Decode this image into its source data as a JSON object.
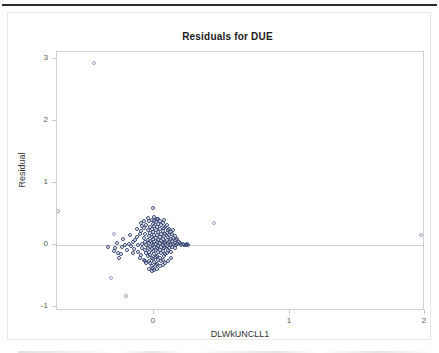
{
  "chart_data": {
    "type": "scatter",
    "title": "Residuals for DUE",
    "xlabel": "DLWkUNCLL1",
    "ylabel": "Residual",
    "xlim": [
      -0.72,
      2.0
    ],
    "ylim": [
      -1.06,
      3.12
    ],
    "xticks": [
      0,
      1,
      2
    ],
    "xtick_labels": [
      "0",
      "1",
      "2"
    ],
    "yticks": [
      -1,
      0,
      1,
      2,
      3
    ],
    "ytick_labels": [
      "-1",
      "0",
      "1",
      "2",
      "3"
    ],
    "grid": false,
    "legend": null,
    "reference_lines": [
      {
        "axis": "y",
        "value": 0,
        "color": "#cfcfcf"
      }
    ],
    "marker": {
      "shape": "open-circle",
      "color": "#3c4a78",
      "size": 4
    },
    "series": [
      {
        "name": "Residuals",
        "points": [
          [
            -0.45,
            2.95
          ],
          [
            -0.71,
            0.55
          ],
          [
            -0.3,
            0.18
          ],
          [
            0.44,
            0.36
          ],
          [
            1.97,
            0.17
          ],
          [
            -0.32,
            -0.53
          ],
          [
            -0.21,
            -0.82
          ],
          [
            -0.26,
            -0.2
          ],
          [
            -0.34,
            -0.02
          ],
          [
            -0.29,
            -0.05
          ],
          [
            -0.3,
            -0.09
          ],
          [
            -0.27,
            -0.12
          ],
          [
            -0.24,
            -0.03
          ],
          [
            -0.22,
            0.01
          ],
          [
            -0.19,
            0.02
          ],
          [
            -0.17,
            -0.01
          ],
          [
            -0.16,
            0.05
          ],
          [
            -0.15,
            -0.06
          ],
          [
            -0.14,
            0.09
          ],
          [
            -0.13,
            0.14
          ],
          [
            -0.12,
            -0.1
          ],
          [
            -0.12,
            0.0
          ],
          [
            -0.11,
            0.18
          ],
          [
            -0.1,
            0.23
          ],
          [
            -0.1,
            -0.16
          ],
          [
            -0.09,
            0.02
          ],
          [
            -0.09,
            -0.04
          ],
          [
            -0.08,
            0.12
          ],
          [
            -0.08,
            0.28
          ],
          [
            -0.08,
            -0.23
          ],
          [
            -0.07,
            0.06
          ],
          [
            -0.07,
            -0.08
          ],
          [
            -0.07,
            0.19
          ],
          [
            -0.06,
            0.33
          ],
          [
            -0.06,
            0.0
          ],
          [
            -0.06,
            -0.13
          ],
          [
            -0.06,
            -0.29
          ],
          [
            -0.05,
            0.09
          ],
          [
            -0.05,
            0.24
          ],
          [
            -0.05,
            -0.05
          ],
          [
            -0.05,
            -0.18
          ],
          [
            -0.04,
            0.39
          ],
          [
            -0.04,
            0.15
          ],
          [
            -0.04,
            0.03
          ],
          [
            -0.04,
            -0.1
          ],
          [
            -0.04,
            -0.25
          ],
          [
            -0.04,
            -0.38
          ],
          [
            -0.03,
            0.3
          ],
          [
            -0.03,
            0.2
          ],
          [
            -0.03,
            0.07
          ],
          [
            -0.03,
            -0.02
          ],
          [
            -0.03,
            -0.15
          ],
          [
            -0.03,
            -0.28
          ],
          [
            -0.02,
            0.41
          ],
          [
            -0.02,
            0.27
          ],
          [
            -0.02,
            0.13
          ],
          [
            -0.02,
            0.04
          ],
          [
            -0.02,
            -0.06
          ],
          [
            -0.02,
            -0.2
          ],
          [
            -0.02,
            -0.33
          ],
          [
            -0.01,
            0.6
          ],
          [
            -0.01,
            0.35
          ],
          [
            -0.01,
            0.22
          ],
          [
            -0.01,
            0.1
          ],
          [
            -0.01,
            0.01
          ],
          [
            -0.01,
            -0.09
          ],
          [
            -0.01,
            -0.22
          ],
          [
            -0.01,
            -0.37
          ],
          [
            0.0,
            0.4
          ],
          [
            0.0,
            0.31
          ],
          [
            0.0,
            0.17
          ],
          [
            0.0,
            0.06
          ],
          [
            0.0,
            -0.03
          ],
          [
            0.0,
            -0.14
          ],
          [
            0.0,
            -0.27
          ],
          [
            0.01,
            0.38
          ],
          [
            0.01,
            0.25
          ],
          [
            0.01,
            0.12
          ],
          [
            0.01,
            0.02
          ],
          [
            0.01,
            -0.07
          ],
          [
            0.01,
            -0.19
          ],
          [
            0.01,
            -0.31
          ],
          [
            0.02,
            0.42
          ],
          [
            0.02,
            0.29
          ],
          [
            0.02,
            0.16
          ],
          [
            0.02,
            0.05
          ],
          [
            0.02,
            -0.04
          ],
          [
            0.02,
            -0.17
          ],
          [
            0.02,
            -0.3
          ],
          [
            0.03,
            0.34
          ],
          [
            0.03,
            0.21
          ],
          [
            0.03,
            0.09
          ],
          [
            0.03,
            -0.01
          ],
          [
            0.03,
            -0.11
          ],
          [
            0.03,
            -0.24
          ],
          [
            0.04,
            0.4
          ],
          [
            0.04,
            0.26
          ],
          [
            0.04,
            0.14
          ],
          [
            0.04,
            0.03
          ],
          [
            0.04,
            -0.08
          ],
          [
            0.04,
            -0.21
          ],
          [
            0.05,
            0.32
          ],
          [
            0.05,
            0.19
          ],
          [
            0.05,
            0.07
          ],
          [
            0.05,
            -0.02
          ],
          [
            0.05,
            -0.13
          ],
          [
            0.05,
            -0.26
          ],
          [
            0.06,
            0.36
          ],
          [
            0.06,
            0.23
          ],
          [
            0.06,
            0.11
          ],
          [
            0.06,
            0.01
          ],
          [
            0.06,
            -0.09
          ],
          [
            0.06,
            -0.23
          ],
          [
            0.07,
            0.41
          ],
          [
            0.07,
            0.28
          ],
          [
            0.07,
            0.15
          ],
          [
            0.07,
            0.04
          ],
          [
            0.07,
            -0.05
          ],
          [
            0.07,
            -0.18
          ],
          [
            0.08,
            0.3
          ],
          [
            0.08,
            0.18
          ],
          [
            0.08,
            0.06
          ],
          [
            0.08,
            -0.03
          ],
          [
            0.08,
            -0.14
          ],
          [
            0.09,
            0.33
          ],
          [
            0.09,
            0.2
          ],
          [
            0.09,
            0.08
          ],
          [
            0.09,
            -0.01
          ],
          [
            0.09,
            -0.12
          ],
          [
            0.1,
            0.25
          ],
          [
            0.1,
            0.13
          ],
          [
            0.1,
            0.03
          ],
          [
            0.1,
            -0.07
          ],
          [
            0.11,
            0.27
          ],
          [
            0.11,
            0.16
          ],
          [
            0.11,
            0.05
          ],
          [
            0.11,
            -0.05
          ],
          [
            0.12,
            0.22
          ],
          [
            0.12,
            0.1
          ],
          [
            0.12,
            0.01
          ],
          [
            0.12,
            -0.1
          ],
          [
            0.13,
            0.19
          ],
          [
            0.13,
            0.07
          ],
          [
            0.13,
            -0.02
          ],
          [
            0.14,
            0.24
          ],
          [
            0.14,
            0.12
          ],
          [
            0.14,
            0.02
          ],
          [
            0.15,
            0.15
          ],
          [
            0.15,
            0.04
          ],
          [
            0.15,
            -0.04
          ],
          [
            0.16,
            0.09
          ],
          [
            0.16,
            0.0
          ],
          [
            0.17,
            0.11
          ],
          [
            0.17,
            0.02
          ],
          [
            0.18,
            0.05
          ],
          [
            0.19,
            0.03
          ],
          [
            0.2,
            0.01
          ],
          [
            0.21,
            0.02
          ],
          [
            0.22,
            0.0
          ],
          [
            0.23,
            0.01
          ],
          [
            0.24,
            0.02
          ],
          [
            0.25,
            0.01
          ],
          [
            -0.28,
            0.04
          ],
          [
            -0.25,
            -0.14
          ],
          [
            -0.23,
            0.11
          ],
          [
            -0.2,
            -0.07
          ],
          [
            -0.18,
            0.16
          ],
          [
            -0.16,
            -0.12
          ],
          [
            -0.13,
            0.26
          ],
          [
            -0.11,
            -0.21
          ],
          [
            -0.09,
            0.31
          ],
          [
            -0.07,
            -0.26
          ],
          [
            -0.05,
            0.44
          ],
          [
            0.0,
            -0.4
          ],
          [
            0.02,
            -0.38
          ],
          [
            0.04,
            -0.34
          ],
          [
            0.06,
            -0.32
          ],
          [
            -0.02,
            -0.42
          ],
          [
            0.08,
            -0.28
          ],
          [
            0.1,
            -0.25
          ],
          [
            0.12,
            -0.21
          ],
          [
            -0.1,
            0.36
          ],
          [
            -0.08,
            0.4
          ],
          [
            0.0,
            0.45
          ],
          [
            0.03,
            0.43
          ]
        ]
      }
    ]
  }
}
